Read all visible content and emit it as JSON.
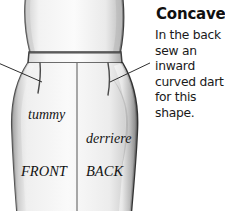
{
  "page": {
    "background_color": "#ffffff",
    "width": 225,
    "height": 211
  },
  "text_panel": {
    "heading": "Concave",
    "body_lines": [
      "In the back",
      "sew an",
      "inward",
      "curved dart",
      "for this",
      "shape."
    ],
    "body_full_text": "In the back sew an inward curved dart for this shape.",
    "heading_color": "#101010",
    "body_color": "#1a1a1a"
  },
  "illustration": {
    "description": "Grayscale pencil drawing of a lower female torso wearing a fitted skirt with a waistband, showing front and back panels",
    "style": "pencil-shaded grayscale sketch",
    "outline_color": "#4a4a4a",
    "shading_color": "#9a9a9a",
    "fill_color": "#f4f4f4",
    "labels": [
      {
        "id": "tummy",
        "text": "tummy",
        "style": "italic-lowercase",
        "x": 28,
        "y": 116
      },
      {
        "id": "derriere",
        "text": "derriere",
        "style": "italic-lowercase",
        "x": 86,
        "y": 140
      },
      {
        "id": "front",
        "text": "FRONT",
        "style": "italic-uppercase",
        "x": 22,
        "y": 172
      },
      {
        "id": "back",
        "text": "BACK",
        "style": "italic-uppercase",
        "x": 86,
        "y": 172
      }
    ],
    "features": {
      "waistband": "horizontal band across the waist",
      "center_seam": "vertical seam dividing FRONT and BACK panels",
      "front_dart": "short curved dart below waistband on front panel",
      "back_dart": "inward curved dart below waistband on back panel"
    },
    "leader_lines": [
      {
        "id": "left-leader",
        "points": "from left edge to front dart"
      },
      {
        "id": "right-leader",
        "points": "from text panel to back hip dart"
      }
    ]
  }
}
